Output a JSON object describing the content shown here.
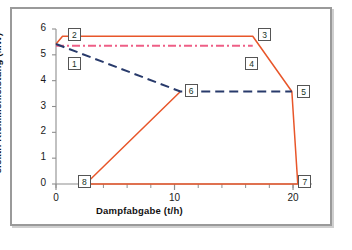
{
  "chart_data": {
    "type": "line",
    "title": "",
    "xlabel": "Dampfabgabe  (t/h)",
    "ylabel": "elektr. Klemmenleistung  (MW)",
    "xlim": [
      0,
      21.6
    ],
    "ylim": [
      0,
      6
    ],
    "xticks": [
      0,
      10,
      20
    ],
    "xtick_labels": [
      "0",
      "10",
      "20"
    ],
    "xminor_step": 2,
    "yticks": [
      0,
      1,
      2,
      3,
      4,
      5,
      6
    ],
    "ytick_labels": [
      "0",
      "1",
      "2",
      "3",
      "4",
      "5",
      "6"
    ],
    "grid": false,
    "legend": "none",
    "series": [
      {
        "name": "max. Klemmenleistung",
        "style": "solid",
        "color": "#e8562a",
        "points": [
          {
            "x": 0.0,
            "y": 5.42
          },
          {
            "x": 0.55,
            "y": 5.72
          },
          {
            "x": 16.6,
            "y": 5.72
          },
          {
            "x": 19.9,
            "y": 3.58
          },
          {
            "x": 20.4,
            "y": 0.0
          },
          {
            "x": 2.5,
            "y": 0.0
          },
          {
            "x": 10.5,
            "y": 3.58
          }
        ]
      },
      {
        "name": "Dampfkennlinie",
        "style": "dash-dot",
        "color": "#ee5f86",
        "points": [
          {
            "x": 0.0,
            "y": 5.35
          },
          {
            "x": 16.6,
            "y": 5.35
          }
        ]
      },
      {
        "name": "min. Klemmenleistung",
        "style": "dashed",
        "color": "#283a6b",
        "points": [
          {
            "x": 0.0,
            "y": 5.42
          },
          {
            "x": 10.5,
            "y": 3.58
          },
          {
            "x": 19.9,
            "y": 3.58
          }
        ]
      }
    ],
    "point_labels": [
      {
        "id": "1",
        "text": "1",
        "x": 1.55,
        "y": 4.66
      },
      {
        "id": "2",
        "text": "2",
        "x": 1.55,
        "y": 5.78
      },
      {
        "id": "3",
        "text": "3",
        "x": 17.6,
        "y": 5.78
      },
      {
        "id": "4",
        "text": "4",
        "x": 16.5,
        "y": 4.68
      },
      {
        "id": "5",
        "text": "5",
        "x": 20.9,
        "y": 3.6
      },
      {
        "id": "6",
        "text": "6",
        "x": 11.4,
        "y": 3.62
      },
      {
        "id": "7",
        "text": "7",
        "x": 21.0,
        "y": 0.1
      },
      {
        "id": "8",
        "text": "8",
        "x": 2.4,
        "y": 0.1
      }
    ]
  },
  "caption": {
    "text": ""
  }
}
